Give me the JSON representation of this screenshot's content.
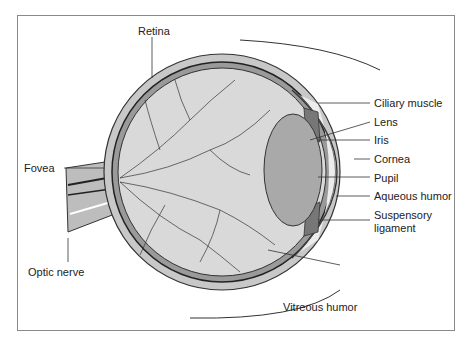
{
  "labels": {
    "retina": "Retina",
    "fovea": "Fovea",
    "optic_nerve": "Optic nerve",
    "vitreous_humor": "Vitreous humor",
    "ciliary_muscle": "Ciliary muscle",
    "lens": "Lens",
    "iris": "Iris",
    "cornea": "Cornea",
    "pupil": "Pupil",
    "aqueous_humor": "Aqueous humor",
    "suspensory_line1": "Suspensory",
    "suspensory_line2": "ligament"
  },
  "colors": {
    "vitreous": "#d9d9d9",
    "lens": "#a9a9a9",
    "aqueous": "#ececec",
    "sclera": "#c8c8c8",
    "line": "#2a2a2a"
  }
}
